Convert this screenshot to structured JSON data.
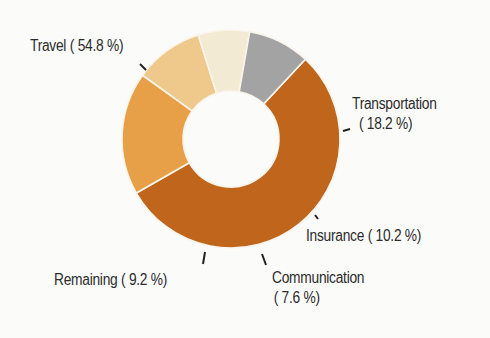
{
  "chart_data": {
    "type": "pie",
    "variant": "donut",
    "title": "",
    "start_angle_deg": 43,
    "direction": "clockwise",
    "slices": [
      {
        "name": "Travel",
        "value": 54.8,
        "label": "Travel ( 54.8 %)",
        "color": "#bf661c"
      },
      {
        "name": "Transportation",
        "value": 18.2,
        "label_line1": "Transportation",
        "label_line2": "( 18.2 %)",
        "color": "#e8a048"
      },
      {
        "name": "Insurance",
        "value": 10.2,
        "label": "Insurance ( 10.2 %)",
        "color": "#efc98c"
      },
      {
        "name": "Communication",
        "value": 7.6,
        "label_line1": "Communication",
        "label_line2": "( 7.6 %)",
        "color": "#f3ead4"
      },
      {
        "name": "Remaining",
        "value": 9.2,
        "label": "Remaining (  9.2 %)",
        "color": "#a3a3a3"
      }
    ],
    "legend": "none",
    "center": [
      231,
      139
    ],
    "outer_radius": 109,
    "inner_radius": 48
  }
}
